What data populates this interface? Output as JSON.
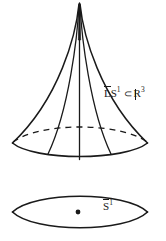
{
  "figure": {
    "kind": "mathematical-diagram",
    "background_color": "#ffffff",
    "ink_color": "#1a1a1a",
    "width": 166,
    "height": 241,
    "cone": {
      "label_parts": {
        "overline_letter": "L",
        "base_symbol": "S",
        "exponent": "1",
        "relation": "⊂",
        "ambient_letter": "R",
        "ambient_exponent": "3"
      },
      "label_text": "L̄S¹ ⊂ ℝ³",
      "apex_point": [
        79,
        3
      ],
      "base_left_tip": [
        12,
        143
      ],
      "base_right_tip": [
        148,
        143
      ],
      "base_front_lowest_y": 160,
      "hidden_back_arc_top_y": 125,
      "hidden_back_arc_style": "dashed",
      "ruling_count": 5
    },
    "lens": {
      "label_parts": {
        "overline_letter": "S",
        "exponent": "1"
      },
      "label_text": "S̄¹",
      "left_tip": [
        12,
        212
      ],
      "right_tip": [
        148,
        212
      ],
      "top_y": 191,
      "bottom_y": 233,
      "center_dot": [
        78,
        212
      ],
      "center_dot_radius": 2.4
    }
  }
}
